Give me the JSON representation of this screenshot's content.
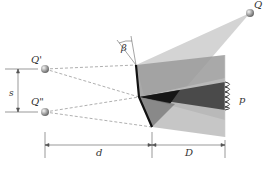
{
  "diagram": {
    "labels": {
      "source": "Q",
      "virtual_source_1": "Q'",
      "virtual_source_2": "Q\"",
      "angle": "β",
      "separation": "s",
      "source_distance": "d",
      "screen_distance": "D",
      "fringes": "p"
    },
    "colors": {
      "beam_light": "#c8c8c8",
      "beam_mid": "#8e8e8e",
      "beam_dark": "#4a4a4a",
      "overlap_darkest": "#161616",
      "mirror": "#111111",
      "dashed": "#9a9a9a",
      "dimension": "#555555"
    }
  }
}
